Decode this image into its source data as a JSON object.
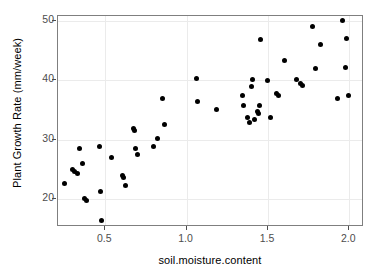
{
  "chart_data": {
    "type": "scatter",
    "title": "",
    "xlabel": "soil.moisture.content",
    "ylabel": "Plant Growth Rate (mm/week)",
    "xlim": [
      0.21,
      2.09
    ],
    "ylim": [
      15.2,
      50.9
    ],
    "xticks": [
      0.5,
      1.0,
      1.5,
      2.0
    ],
    "xtick_labels": [
      "0.5",
      "1.0",
      "1.5",
      "2.0"
    ],
    "yticks": [
      20,
      30,
      40,
      50
    ],
    "ytick_labels": [
      "20",
      "30",
      "40",
      "50"
    ],
    "grid": true,
    "grid_color": "#ebebeb",
    "panel_background": "#ffffff",
    "panel_border_color": "#7f7f7f",
    "point_color": "#000000",
    "point_size": 5,
    "legend": null,
    "points": [
      {
        "x": 0.25,
        "y": 22.6
      },
      {
        "x": 0.3,
        "y": 24.9
      },
      {
        "x": 0.31,
        "y": 24.6
      },
      {
        "x": 0.33,
        "y": 24.3
      },
      {
        "x": 0.345,
        "y": 28.4
      },
      {
        "x": 0.36,
        "y": 26.0
      },
      {
        "x": 0.375,
        "y": 20.1
      },
      {
        "x": 0.385,
        "y": 19.7
      },
      {
        "x": 0.465,
        "y": 28.8
      },
      {
        "x": 0.47,
        "y": 21.2
      },
      {
        "x": 0.475,
        "y": 16.3
      },
      {
        "x": 0.54,
        "y": 27.0
      },
      {
        "x": 0.605,
        "y": 23.9
      },
      {
        "x": 0.615,
        "y": 23.6
      },
      {
        "x": 0.625,
        "y": 22.2
      },
      {
        "x": 0.675,
        "y": 31.9
      },
      {
        "x": 0.68,
        "y": 31.5
      },
      {
        "x": 0.685,
        "y": 28.4
      },
      {
        "x": 0.7,
        "y": 27.4
      },
      {
        "x": 0.795,
        "y": 28.9
      },
      {
        "x": 0.82,
        "y": 30.1
      },
      {
        "x": 0.855,
        "y": 37.0
      },
      {
        "x": 0.865,
        "y": 32.6
      },
      {
        "x": 1.06,
        "y": 40.3
      },
      {
        "x": 1.07,
        "y": 36.4
      },
      {
        "x": 1.185,
        "y": 35.1
      },
      {
        "x": 1.345,
        "y": 37.4
      },
      {
        "x": 1.35,
        "y": 35.7
      },
      {
        "x": 1.375,
        "y": 33.7
      },
      {
        "x": 1.385,
        "y": 32.9
      },
      {
        "x": 1.4,
        "y": 39.0
      },
      {
        "x": 1.405,
        "y": 40.1
      },
      {
        "x": 1.415,
        "y": 33.4
      },
      {
        "x": 1.435,
        "y": 34.7
      },
      {
        "x": 1.44,
        "y": 34.4
      },
      {
        "x": 1.45,
        "y": 35.8
      },
      {
        "x": 1.455,
        "y": 46.9
      },
      {
        "x": 1.5,
        "y": 40.0
      },
      {
        "x": 1.515,
        "y": 33.7
      },
      {
        "x": 1.555,
        "y": 37.8
      },
      {
        "x": 1.565,
        "y": 37.4
      },
      {
        "x": 1.6,
        "y": 43.4
      },
      {
        "x": 1.675,
        "y": 40.2
      },
      {
        "x": 1.7,
        "y": 39.4
      },
      {
        "x": 1.715,
        "y": 39.1
      },
      {
        "x": 1.775,
        "y": 49.2
      },
      {
        "x": 1.79,
        "y": 42.0
      },
      {
        "x": 1.82,
        "y": 46.1
      },
      {
        "x": 1.925,
        "y": 36.9
      },
      {
        "x": 1.955,
        "y": 50.1
      },
      {
        "x": 1.975,
        "y": 42.2
      },
      {
        "x": 1.985,
        "y": 47.1
      },
      {
        "x": 1.995,
        "y": 37.4
      }
    ]
  }
}
